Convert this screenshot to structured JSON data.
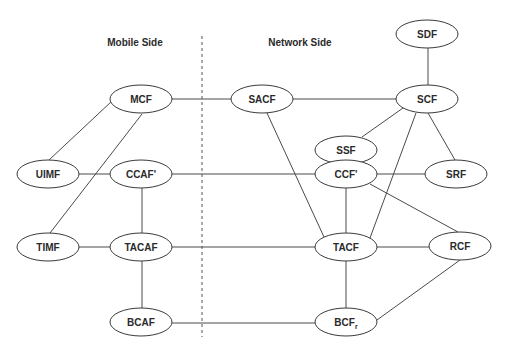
{
  "diagram": {
    "type": "functional-entity-architecture",
    "divider": {
      "x": 202,
      "y1": 36,
      "y2": 337
    },
    "side_labels": [
      {
        "id": "mobile",
        "text": "Mobile Side",
        "x": 135,
        "y": 46
      },
      {
        "id": "network",
        "text": "Network Side",
        "x": 300,
        "y": 46
      }
    ],
    "nodes": [
      {
        "id": "SDF",
        "label": "SDF",
        "sub": "",
        "cx": 427,
        "cy": 34,
        "rx": 31,
        "ry": 14
      },
      {
        "id": "MCF",
        "label": "MCF",
        "sub": "",
        "cx": 141,
        "cy": 99,
        "rx": 31,
        "ry": 14
      },
      {
        "id": "SACF",
        "label": "SACF",
        "sub": "",
        "cx": 262,
        "cy": 99,
        "rx": 31,
        "ry": 14
      },
      {
        "id": "SCF",
        "label": "SCF",
        "sub": "",
        "cx": 427,
        "cy": 99,
        "rx": 31,
        "ry": 14
      },
      {
        "id": "SSF",
        "label": "SSF",
        "sub": "",
        "cx": 346,
        "cy": 150,
        "rx": 31,
        "ry": 14
      },
      {
        "id": "UIMF",
        "label": "UIMF",
        "sub": "",
        "cx": 48,
        "cy": 174,
        "rx": 31,
        "ry": 14
      },
      {
        "id": "CCAF",
        "label": "CCAF'",
        "sub": "",
        "cx": 141,
        "cy": 174,
        "rx": 31,
        "ry": 14
      },
      {
        "id": "CCF",
        "label": "CCF'",
        "sub": "",
        "cx": 346,
        "cy": 174,
        "rx": 31,
        "ry": 14
      },
      {
        "id": "SRF",
        "label": "SRF",
        "sub": "",
        "cx": 456,
        "cy": 174,
        "rx": 31,
        "ry": 14
      },
      {
        "id": "TIMF",
        "label": "TIMF",
        "sub": "",
        "cx": 48,
        "cy": 247,
        "rx": 31,
        "ry": 14
      },
      {
        "id": "TACAF",
        "label": "TACAF",
        "sub": "",
        "cx": 141,
        "cy": 247,
        "rx": 31,
        "ry": 14
      },
      {
        "id": "TACF",
        "label": "TACF",
        "sub": "",
        "cx": 346,
        "cy": 247,
        "rx": 31,
        "ry": 14
      },
      {
        "id": "RCF",
        "label": "RCF",
        "sub": "",
        "cx": 460,
        "cy": 246,
        "rx": 31,
        "ry": 14
      },
      {
        "id": "BCAF",
        "label": "BCAF",
        "sub": "",
        "cx": 141,
        "cy": 322,
        "rx": 31,
        "ry": 14
      },
      {
        "id": "BCFr",
        "label": "BCF",
        "sub": "r",
        "cx": 346,
        "cy": 322,
        "rx": 31,
        "ry": 14
      }
    ],
    "edges": [
      {
        "from": "SDF",
        "to": "SCF",
        "x1": 428,
        "y1": 48,
        "x2": 428,
        "y2": 85
      },
      {
        "from": "MCF",
        "to": "SACF",
        "x1": 172,
        "y1": 99,
        "x2": 231,
        "y2": 99
      },
      {
        "from": "SACF",
        "to": "SCF",
        "x1": 293,
        "y1": 99,
        "x2": 396,
        "y2": 99
      },
      {
        "from": "MCF",
        "to": "UIMF",
        "x1": 112,
        "y1": 101,
        "x2": 49,
        "y2": 160
      },
      {
        "from": "MCF",
        "to": "TIMF",
        "x1": 142,
        "y1": 114,
        "x2": 50,
        "y2": 233
      },
      {
        "from": "SACF",
        "to": "TACF",
        "x1": 267,
        "y1": 113,
        "x2": 324,
        "y2": 237
      },
      {
        "from": "SCF",
        "to": "SSF",
        "x1": 403,
        "y1": 108,
        "x2": 362,
        "y2": 137
      },
      {
        "from": "SCF",
        "to": "TACF",
        "x1": 416,
        "y1": 113,
        "x2": 370,
        "y2": 238
      },
      {
        "from": "SCF",
        "to": "SRF",
        "x1": 428,
        "y1": 113,
        "x2": 455,
        "y2": 160
      },
      {
        "from": "UIMF",
        "to": "CCAF",
        "x1": 79,
        "y1": 174,
        "x2": 110,
        "y2": 174
      },
      {
        "from": "CCAF",
        "to": "CCF",
        "x1": 172,
        "y1": 174,
        "x2": 315,
        "y2": 174
      },
      {
        "from": "CCF",
        "to": "SRF",
        "x1": 377,
        "y1": 174,
        "x2": 425,
        "y2": 174
      },
      {
        "from": "CCAF",
        "to": "TACAF",
        "x1": 142,
        "y1": 188,
        "x2": 142,
        "y2": 233
      },
      {
        "from": "CCF",
        "to": "TACF",
        "x1": 346,
        "y1": 188,
        "x2": 346,
        "y2": 233
      },
      {
        "from": "CCF",
        "to": "RCF",
        "x1": 370,
        "y1": 184,
        "x2": 458,
        "y2": 232
      },
      {
        "from": "TIMF",
        "to": "TACAF",
        "x1": 79,
        "y1": 247,
        "x2": 110,
        "y2": 247
      },
      {
        "from": "TACAF",
        "to": "TACF",
        "x1": 172,
        "y1": 247,
        "x2": 315,
        "y2": 247
      },
      {
        "from": "TACF",
        "to": "RCF",
        "x1": 377,
        "y1": 247,
        "x2": 429,
        "y2": 247
      },
      {
        "from": "TACAF",
        "to": "BCAF",
        "x1": 142,
        "y1": 261,
        "x2": 142,
        "y2": 308
      },
      {
        "from": "TACF",
        "to": "BCFr",
        "x1": 346,
        "y1": 261,
        "x2": 346,
        "y2": 308
      },
      {
        "from": "BCAF",
        "to": "BCFr",
        "x1": 172,
        "y1": 323,
        "x2": 315,
        "y2": 323
      },
      {
        "from": "RCF",
        "to": "BCFr",
        "x1": 460,
        "y1": 260,
        "x2": 377,
        "y2": 320
      }
    ]
  }
}
